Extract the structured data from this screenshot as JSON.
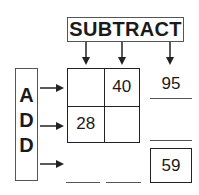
{
  "header": {
    "label": "SUBTRACT"
  },
  "side": {
    "letters": [
      "A",
      "D",
      "D"
    ]
  },
  "grid": {
    "cells": [
      {
        "row": 0,
        "col": 0,
        "value": ""
      },
      {
        "row": 0,
        "col": 1,
        "value": "40"
      },
      {
        "row": 1,
        "col": 0,
        "value": "28"
      },
      {
        "row": 1,
        "col": 1,
        "value": ""
      }
    ]
  },
  "column_totals": {
    "col1": "",
    "col2": ""
  },
  "row_totals": {
    "row1": "95",
    "row2": ""
  },
  "grand_total": "59",
  "colors": {
    "stroke": "#222222",
    "box_border": "#555555",
    "text": "#1a1a1a",
    "background": "#ffffff"
  }
}
